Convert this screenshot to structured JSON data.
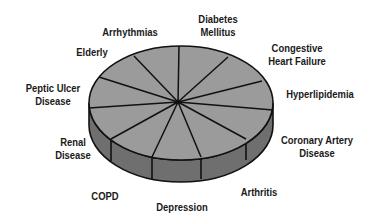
{
  "diagram": {
    "type": "3d-pie",
    "colors": {
      "top": "#9b9b9b",
      "side": "#6f6f6f",
      "outline": "#111111",
      "label": "#1a1a1a",
      "background": "#ffffff"
    },
    "slices": [
      {
        "label": "Diabetes\nMellitus"
      },
      {
        "label": "Congestive\nHeart Failure"
      },
      {
        "label": "Hyperlipidemia"
      },
      {
        "label": "Coronary Artery\nDisease"
      },
      {
        "label": "Arthritis"
      },
      {
        "label": "Depression"
      },
      {
        "label": "COPD"
      },
      {
        "label": "Renal\nDisease"
      },
      {
        "label": "Peptic Ulcer\nDisease"
      },
      {
        "label": "Elderly"
      },
      {
        "label": "Arrhythmias"
      }
    ]
  }
}
